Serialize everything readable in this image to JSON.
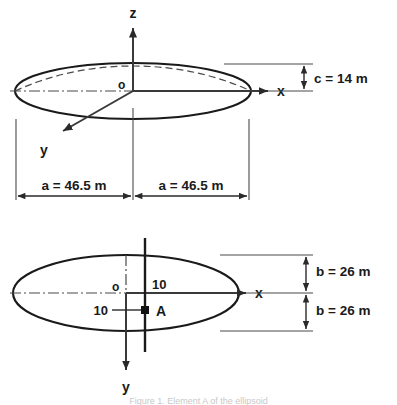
{
  "figure": {
    "caption": "Figure 1. Element A of the ellipsoid",
    "caption_visible": false
  },
  "top_view": {
    "name": "elevation-view",
    "axes": {
      "z_label": "z",
      "x_label": "x",
      "y_label": "y",
      "origin_label": "o"
    },
    "dimensions": [
      {
        "id": "a-left",
        "label": "a = 46.5 m"
      },
      {
        "id": "a-right",
        "label": "a = 46.5 m"
      },
      {
        "id": "c",
        "label": "c = 14 m"
      }
    ]
  },
  "bottom_view": {
    "name": "plan-view",
    "axes": {
      "x_label": "x",
      "y_label": "y",
      "origin_label": "o"
    },
    "point": {
      "label": "A",
      "offset_x": "10",
      "offset_y": "10"
    },
    "dimensions": [
      {
        "id": "b-upper",
        "label": "b = 26 m"
      },
      {
        "id": "b-lower",
        "label": "b = 26 m"
      }
    ]
  },
  "colors": {
    "stroke": "#1a1a1a",
    "thin_stroke": "#4a4a4a",
    "background": "#ffffff"
  }
}
